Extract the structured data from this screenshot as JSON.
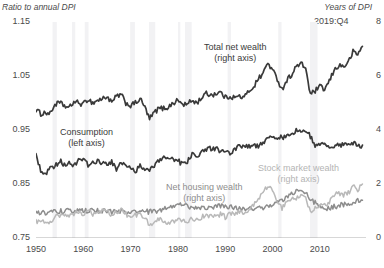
{
  "chart_data": {
    "type": "line",
    "title": "",
    "ylabel_left": "Ratio to annual DPI",
    "ylabel_right": "Years of DPI",
    "xlabel": "",
    "xlim": [
      1950,
      2019.75
    ],
    "ylim_left": [
      0.75,
      1.15
    ],
    "ylim_right": [
      0,
      8
    ],
    "grid": false,
    "legend_position": "inline-annotations",
    "annotation": "2019:Q4",
    "yticks_left": [
      "1.15",
      "1.05",
      "0.95",
      "0.85",
      "0.75"
    ],
    "yticks_left_values": [
      1.15,
      1.05,
      0.95,
      0.85,
      0.75
    ],
    "yticks_right": [
      "8",
      "6",
      "4",
      "2",
      "0"
    ],
    "yticks_right_values": [
      8,
      6,
      4,
      2,
      0
    ],
    "xticks": [
      "1950",
      "1960",
      "1970",
      "1980",
      "1990",
      "2000",
      "2010"
    ],
    "xticks_values": [
      1950,
      1960,
      1970,
      1980,
      1990,
      2000,
      2010
    ],
    "recession_bands": [
      [
        1953.5,
        1954.4
      ],
      [
        1957.6,
        1958.3
      ],
      [
        1960.3,
        1961.1
      ],
      [
        1969.9,
        1970.9
      ],
      [
        1973.9,
        1975.2
      ],
      [
        1980.0,
        1980.5
      ],
      [
        1981.5,
        1982.9
      ],
      [
        1990.5,
        1991.2
      ],
      [
        2001.2,
        2001.9
      ],
      [
        2007.9,
        2009.5
      ]
    ],
    "series": [
      {
        "name": "Total net wealth",
        "axis": "right",
        "label": "Total net wealth",
        "sublabel": "(right axis)",
        "color": "#3a3a3a",
        "x": [
          1950,
          1951,
          1952,
          1953,
          1954,
          1955,
          1956,
          1957,
          1958,
          1959,
          1960,
          1961,
          1962,
          1963,
          1964,
          1965,
          1966,
          1967,
          1968,
          1969,
          1970,
          1971,
          1972,
          1973,
          1974,
          1975,
          1976,
          1977,
          1978,
          1979,
          1980,
          1981,
          1982,
          1983,
          1984,
          1985,
          1986,
          1987,
          1988,
          1989,
          1990,
          1991,
          1992,
          1993,
          1994,
          1995,
          1996,
          1997,
          1998,
          1999,
          2000,
          2001,
          2002,
          2003,
          2004,
          2005,
          2006,
          2007,
          2008,
          2009,
          2010,
          2011,
          2012,
          2013,
          2014,
          2015,
          2016,
          2017,
          2018,
          2019
        ],
        "values": [
          4.75,
          4.6,
          4.65,
          4.6,
          4.95,
          5.0,
          4.9,
          4.8,
          5.05,
          5.0,
          4.95,
          5.15,
          5.0,
          5.1,
          5.15,
          5.25,
          5.0,
          5.25,
          5.3,
          5.0,
          4.9,
          5.0,
          5.15,
          4.85,
          4.4,
          4.65,
          4.8,
          4.8,
          4.85,
          5.0,
          5.1,
          4.95,
          4.95,
          5.1,
          5.0,
          5.2,
          5.35,
          5.3,
          5.35,
          5.4,
          5.2,
          5.25,
          5.2,
          5.25,
          5.2,
          5.45,
          5.6,
          5.9,
          6.1,
          6.5,
          6.2,
          5.9,
          5.5,
          5.85,
          6.05,
          6.35,
          6.45,
          6.3,
          5.3,
          5.45,
          5.6,
          5.5,
          5.8,
          6.2,
          6.4,
          6.35,
          6.5,
          6.9,
          6.8,
          7.1
        ]
      },
      {
        "name": "Consumption",
        "axis": "left",
        "label": "Consumption",
        "sublabel": "(left axis)",
        "color": "#3a3a3a",
        "x": [
          1950,
          1951,
          1952,
          1953,
          1954,
          1955,
          1956,
          1957,
          1958,
          1959,
          1960,
          1961,
          1962,
          1963,
          1964,
          1965,
          1966,
          1967,
          1968,
          1969,
          1970,
          1971,
          1972,
          1973,
          1974,
          1975,
          1976,
          1977,
          1978,
          1979,
          1980,
          1981,
          1982,
          1983,
          1984,
          1985,
          1986,
          1987,
          1988,
          1989,
          1990,
          1991,
          1992,
          1993,
          1994,
          1995,
          1996,
          1997,
          1998,
          1999,
          2000,
          2001,
          2002,
          2003,
          2004,
          2005,
          2006,
          2007,
          2008,
          2009,
          2010,
          2011,
          2012,
          2013,
          2014,
          2015,
          2016,
          2017,
          2018,
          2019
        ],
        "values": [
          0.905,
          0.875,
          0.87,
          0.878,
          0.882,
          0.893,
          0.886,
          0.889,
          0.885,
          0.893,
          0.893,
          0.885,
          0.888,
          0.893,
          0.888,
          0.889,
          0.89,
          0.878,
          0.888,
          0.888,
          0.878,
          0.874,
          0.884,
          0.872,
          0.878,
          0.882,
          0.893,
          0.898,
          0.897,
          0.898,
          0.893,
          0.886,
          0.893,
          0.906,
          0.898,
          0.912,
          0.915,
          0.915,
          0.915,
          0.912,
          0.914,
          0.908,
          0.912,
          0.92,
          0.922,
          0.921,
          0.922,
          0.921,
          0.926,
          0.936,
          0.938,
          0.936,
          0.936,
          0.94,
          0.942,
          0.949,
          0.948,
          0.948,
          0.938,
          0.918,
          0.922,
          0.922,
          0.918,
          0.922,
          0.924,
          0.921,
          0.925,
          0.926,
          0.921,
          0.922
        ]
      },
      {
        "name": "Net housing wealth",
        "axis": "right",
        "label": "Net housing wealth",
        "sublabel": "(right axis)",
        "color": "#8d8d8d",
        "x": [
          1950,
          1951,
          1952,
          1953,
          1954,
          1955,
          1956,
          1957,
          1958,
          1959,
          1960,
          1961,
          1962,
          1963,
          1964,
          1965,
          1966,
          1967,
          1968,
          1969,
          1970,
          1971,
          1972,
          1973,
          1974,
          1975,
          1976,
          1977,
          1978,
          1979,
          1980,
          1981,
          1982,
          1983,
          1984,
          1985,
          1986,
          1987,
          1988,
          1989,
          1990,
          1991,
          1992,
          1993,
          1994,
          1995,
          1996,
          1997,
          1998,
          1999,
          2000,
          2001,
          2002,
          2003,
          2004,
          2005,
          2006,
          2007,
          2008,
          2009,
          2010,
          2011,
          2012,
          2013,
          2014,
          2015,
          2016,
          2017,
          2018,
          2019
        ],
        "values": [
          0.95,
          0.93,
          0.94,
          0.95,
          0.98,
          1.0,
          1.0,
          0.99,
          1.0,
          1.0,
          1.0,
          1.0,
          1.0,
          1.0,
          1.0,
          0.99,
          0.97,
          0.96,
          0.97,
          0.97,
          0.95,
          0.96,
          0.98,
          0.98,
          0.97,
          0.99,
          1.0,
          1.06,
          1.12,
          1.2,
          1.25,
          1.22,
          1.17,
          1.14,
          1.12,
          1.12,
          1.14,
          1.16,
          1.18,
          1.2,
          1.18,
          1.14,
          1.12,
          1.1,
          1.1,
          1.1,
          1.1,
          1.12,
          1.14,
          1.18,
          1.22,
          1.3,
          1.4,
          1.5,
          1.62,
          1.75,
          1.78,
          1.65,
          1.42,
          1.3,
          1.22,
          1.12,
          1.1,
          1.16,
          1.2,
          1.24,
          1.28,
          1.34,
          1.38,
          1.4
        ]
      },
      {
        "name": "Stock market wealth",
        "axis": "right",
        "label": "Stock market wealth",
        "sublabel": "(right axis)",
        "color": "#b9b9b9",
        "x": [
          1950,
          1951,
          1952,
          1953,
          1954,
          1955,
          1956,
          1957,
          1958,
          1959,
          1960,
          1961,
          1962,
          1963,
          1964,
          1965,
          1966,
          1967,
          1968,
          1969,
          1970,
          1971,
          1972,
          1973,
          1974,
          1975,
          1976,
          1977,
          1978,
          1979,
          1980,
          1981,
          1982,
          1983,
          1984,
          1985,
          1986,
          1987,
          1988,
          1989,
          1990,
          1991,
          1992,
          1993,
          1994,
          1995,
          1996,
          1997,
          1998,
          1999,
          2000,
          2001,
          2002,
          2003,
          2004,
          2005,
          2006,
          2007,
          2008,
          2009,
          2010,
          2011,
          2012,
          2013,
          2014,
          2015,
          2016,
          2017,
          2018,
          2019
        ],
        "values": [
          0.6,
          0.62,
          0.63,
          0.6,
          0.75,
          0.85,
          0.85,
          0.75,
          0.92,
          0.95,
          0.9,
          1.0,
          0.88,
          0.95,
          0.98,
          1.0,
          0.85,
          0.98,
          1.02,
          0.88,
          0.78,
          0.85,
          0.92,
          0.75,
          0.5,
          0.62,
          0.68,
          0.6,
          0.58,
          0.6,
          0.68,
          0.6,
          0.62,
          0.72,
          0.66,
          0.78,
          0.85,
          0.78,
          0.8,
          0.88,
          0.78,
          0.9,
          0.92,
          0.95,
          0.9,
          1.05,
          1.2,
          1.45,
          1.65,
          1.95,
          1.72,
          1.4,
          1.08,
          1.35,
          1.45,
          1.5,
          1.6,
          1.58,
          0.92,
          1.12,
          1.25,
          1.2,
          1.35,
          1.6,
          1.68,
          1.6,
          1.68,
          1.9,
          1.78,
          2.0
        ]
      }
    ]
  }
}
